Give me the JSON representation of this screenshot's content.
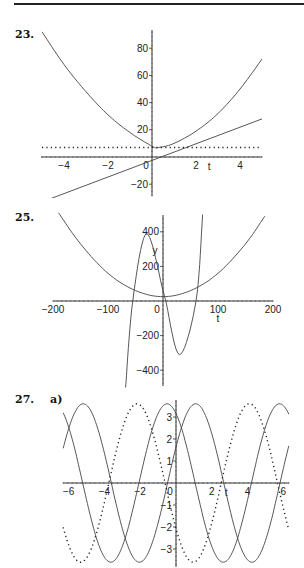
{
  "problems": [
    {
      "number": "23.",
      "part": ""
    },
    {
      "number": "25.",
      "part": ""
    },
    {
      "number": "27.",
      "part": "a)"
    }
  ],
  "chart_data": [
    {
      "type": "line",
      "title": "23.",
      "xlabel": "t",
      "ylabel": "",
      "xlim": [
        -5,
        5
      ],
      "ylim": [
        -35,
        95
      ],
      "x_ticks": [
        -4,
        -2,
        0,
        2,
        4
      ],
      "x_tick_labels": [
        "-4",
        "-2",
        "0",
        "2",
        "4"
      ],
      "y_ticks": [
        -20,
        20,
        40,
        60,
        80
      ],
      "y_tick_labels": [
        "-20",
        "20",
        "40",
        "60",
        "80"
      ],
      "grid": false,
      "series": [
        {
          "name": "parabola",
          "style": "solid",
          "kind": "quadratic",
          "x": [
            -5,
            -4,
            -3,
            -2,
            -1,
            0,
            0.3,
            1,
            2,
            3,
            4,
            5
          ],
          "values": [
            92,
            68,
            48,
            31,
            18,
            8,
            7,
            10,
            19,
            32,
            50,
            72
          ]
        },
        {
          "name": "tangent line",
          "style": "solid",
          "kind": "linear",
          "x": [
            -5,
            5
          ],
          "values": [
            -33,
            28
          ]
        },
        {
          "name": "horizontal line",
          "style": "dotted",
          "kind": "constant",
          "x": [
            -5,
            5
          ],
          "values": [
            7,
            7
          ]
        }
      ]
    },
    {
      "type": "line",
      "title": "25.",
      "xlabel": "t",
      "ylabel": "y",
      "xlim": [
        -200,
        200
      ],
      "ylim": [
        -500,
        500
      ],
      "x_ticks": [
        -200,
        -100,
        0,
        100,
        200
      ],
      "x_tick_labels": [
        "-200",
        "-100",
        "0",
        "100",
        "200"
      ],
      "y_ticks": [
        -400,
        -200,
        200,
        400
      ],
      "y_tick_labels": [
        "-400",
        "-200",
        "200",
        "400"
      ],
      "grid": false,
      "series": [
        {
          "name": "parabola",
          "style": "solid",
          "kind": "quadratic",
          "x": [
            -190,
            -150,
            -100,
            -50,
            0,
            50,
            100,
            150,
            185
          ],
          "values": [
            510,
            330,
            160,
            60,
            25,
            60,
            160,
            330,
            490
          ]
        },
        {
          "name": "cubic",
          "style": "solid",
          "kind": "cubic",
          "x": [
            -68,
            -55,
            -30,
            0,
            5,
            30,
            60,
            72
          ],
          "values": [
            -500,
            0,
            390,
            60,
            0,
            -310,
            0,
            500
          ]
        }
      ]
    },
    {
      "type": "line",
      "title": "27. a)",
      "xlabel": "t",
      "ylabel": "",
      "xlim": [
        -6.3,
        6.3
      ],
      "ylim": [
        -3.7,
        3.7
      ],
      "x_ticks": [
        -6,
        -4,
        -2,
        0,
        2,
        4,
        6
      ],
      "x_tick_labels": [
        "-6",
        "-4",
        "-2",
        "0",
        "2",
        "4",
        "6"
      ],
      "y_ticks": [
        -3,
        -2,
        -1,
        1,
        2,
        3
      ],
      "y_tick_labels": [
        "-3",
        "-2",
        "-1",
        "1",
        "2",
        "3"
      ],
      "grid": false,
      "series": [
        {
          "name": "sinusoid 1",
          "style": "solid",
          "kind": "cosine",
          "amplitude": 3.6,
          "peak_t": -0.5
        },
        {
          "name": "sinusoid 2",
          "style": "solid",
          "kind": "cosine",
          "amplitude": 3.6,
          "peak_t": 1.1
        },
        {
          "name": "sinusoid 3",
          "style": "dotted",
          "kind": "cosine",
          "amplitude": 3.6,
          "peak_t": 4.1
        }
      ]
    }
  ]
}
